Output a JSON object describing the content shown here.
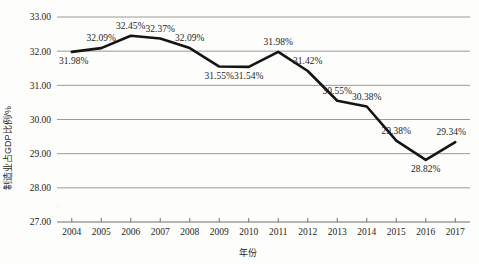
{
  "chart_data": {
    "type": "line",
    "title": "",
    "xlabel": "年份",
    "ylabel": "制造业占GDP比例/%",
    "categories": [
      "2004",
      "2005",
      "2006",
      "2007",
      "2008",
      "2009",
      "2010",
      "2011",
      "2012",
      "2013",
      "2014",
      "2015",
      "2016",
      "2017"
    ],
    "values": [
      31.98,
      32.09,
      32.45,
      32.37,
      32.09,
      31.55,
      31.54,
      31.98,
      31.42,
      30.55,
      30.38,
      29.38,
      28.82,
      29.34
    ],
    "point_labels": [
      "31.98%",
      "32.09%",
      "32.45%",
      "32.37%",
      "32.09%",
      "31.55%",
      "31.54%",
      "31.98%",
      "31.42%",
      "30.55%",
      "30.38%",
      "29.38%",
      "28.82%",
      "29.34%"
    ],
    "ylim": [
      27.0,
      33.0
    ],
    "ytick_labels": [
      "33.00",
      "32.00",
      "31.00",
      "30.00",
      "29.00",
      "28.00",
      "27.00"
    ],
    "ytick_values": [
      33.0,
      32.0,
      31.0,
      30.0,
      29.0,
      28.0,
      27.0
    ],
    "grid": true,
    "legend": "none",
    "series_color": "#141414",
    "grid_color": "#8e8e8e",
    "markers": false,
    "label_positions": [
      "below",
      "above",
      "above",
      "above",
      "above",
      "below",
      "below",
      "above",
      "above",
      "above",
      "above",
      "above",
      "below",
      "above"
    ]
  },
  "axis": {
    "y_title": "制造业占GDP比例/%",
    "x_title": "年份"
  }
}
